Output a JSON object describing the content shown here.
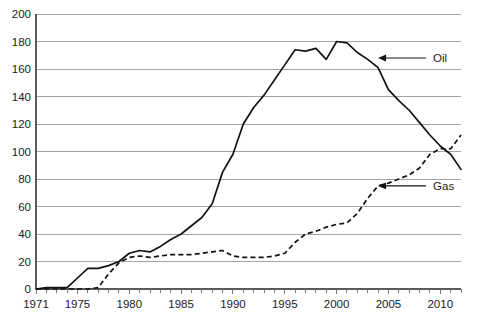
{
  "chart_data": {
    "type": "line",
    "title": "",
    "subtitle": "",
    "xlabel": "",
    "ylabel": "",
    "xlim": [
      1971,
      2012
    ],
    "ylim": [
      0,
      200
    ],
    "yticks": [
      0,
      20,
      40,
      60,
      80,
      100,
      120,
      140,
      160,
      180,
      200
    ],
    "xticks": [
      1971,
      1975,
      1980,
      1985,
      1990,
      1995,
      2000,
      2005,
      2010
    ],
    "xtick_labels": [
      "1971",
      "1975",
      "1980",
      "1985",
      "1990",
      "1995",
      "2000",
      "2005",
      "2010"
    ],
    "ytick_labels": [
      "0",
      "20",
      "40",
      "60",
      "80",
      "100",
      "120",
      "140",
      "160",
      "180",
      "200"
    ],
    "x_minor_tick_interval": 1,
    "grid": "horizontal",
    "legend": "inline-annotations",
    "x": [
      1971,
      1972,
      1973,
      1974,
      1975,
      1976,
      1977,
      1978,
      1979,
      1980,
      1981,
      1982,
      1983,
      1984,
      1985,
      1986,
      1987,
      1988,
      1989,
      1990,
      1991,
      1992,
      1993,
      1994,
      1995,
      1996,
      1997,
      1998,
      1999,
      2000,
      2001,
      2002,
      2003,
      2004,
      2005,
      2006,
      2007,
      2008,
      2009,
      2010,
      2011,
      2012
    ],
    "series": [
      {
        "name": "Oil",
        "style": "solid",
        "color": "#121212",
        "annotation_label": "Oil",
        "values": [
          0,
          1,
          1,
          1,
          8,
          15,
          15,
          17,
          20,
          26,
          28,
          27,
          31,
          36,
          40,
          46,
          52,
          62,
          85,
          98,
          120,
          132,
          141,
          152,
          163,
          174,
          173,
          175,
          167,
          180,
          179,
          172,
          167,
          161,
          145,
          137,
          130,
          121,
          112,
          104,
          98,
          87
        ]
      },
      {
        "name": "Gas",
        "style": "dashed",
        "color": "#121212",
        "annotation_label": "Gas",
        "values": [
          0,
          0,
          0,
          0,
          0,
          0,
          1,
          11,
          19,
          23,
          24,
          23,
          24,
          25,
          25,
          25,
          26,
          27,
          28,
          24,
          23,
          23,
          23,
          24,
          26,
          34,
          40,
          42,
          45,
          47,
          48,
          55,
          66,
          75,
          77,
          80,
          83,
          88,
          98,
          102,
          102,
          112
        ]
      }
    ],
    "annotations": [
      {
        "name": "oil-annotation",
        "label": "Oil",
        "arrow": "left",
        "target_year": 2004,
        "target_value": 168
      },
      {
        "name": "gas-annotation",
        "label": "Gas",
        "arrow": "left",
        "target_year": 2004,
        "target_value": 75
      }
    ]
  }
}
